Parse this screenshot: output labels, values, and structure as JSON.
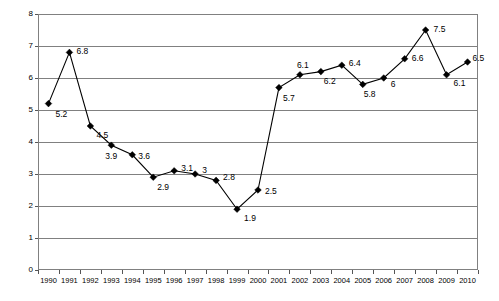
{
  "chart_data": {
    "type": "line",
    "title": "",
    "xlabel": "",
    "ylabel": "",
    "categories": [
      "1990",
      "1991",
      "1992",
      "1993",
      "1994",
      "1995",
      "1996",
      "1997",
      "1998",
      "1999",
      "2000",
      "2001",
      "2002",
      "2003",
      "2004",
      "2005",
      "2006",
      "2007",
      "2008",
      "2009",
      "2010"
    ],
    "values": [
      5.2,
      6.8,
      4.5,
      3.9,
      3.6,
      2.9,
      3.1,
      3.0,
      2.8,
      1.9,
      2.5,
      5.7,
      6.1,
      6.2,
      6.4,
      5.8,
      6.0,
      6.6,
      7.5,
      6.1,
      6.5
    ],
    "data_labels": [
      "5.2",
      "6.8",
      "4.5",
      "3.9",
      "3.6",
      "2.9",
      "3.1",
      "3",
      "2.8",
      "1.9",
      "2.5",
      "5.7",
      "6.1",
      "6.2",
      "6.4",
      "5.8",
      "6",
      "6.6",
      "7.5",
      "6.1",
      "6.5"
    ],
    "label_offsets": [
      {
        "dx": 7,
        "dy": 10
      },
      {
        "dx": 7,
        "dy": -1
      },
      {
        "dx": 6,
        "dy": 9
      },
      {
        "dx": -6,
        "dy": 11
      },
      {
        "dx": 6,
        "dy": 1
      },
      {
        "dx": 4,
        "dy": 10
      },
      {
        "dx": 7,
        "dy": -3
      },
      {
        "dx": 7,
        "dy": -4
      },
      {
        "dx": 7,
        "dy": -3
      },
      {
        "dx": 7,
        "dy": 9
      },
      {
        "dx": 7,
        "dy": 1
      },
      {
        "dx": 4,
        "dy": 10
      },
      {
        "dx": -3,
        "dy": -10
      },
      {
        "dx": 3,
        "dy": 9
      },
      {
        "dx": 7,
        "dy": -2
      },
      {
        "dx": 1,
        "dy": 10
      },
      {
        "dx": 7,
        "dy": 6
      },
      {
        "dx": 7,
        "dy": -1
      },
      {
        "dx": 8,
        "dy": -1
      },
      {
        "dx": 7,
        "dy": 8
      },
      {
        "dx": 5,
        "dy": -4
      }
    ],
    "ylim": [
      0,
      8
    ],
    "ytick_values": [
      0,
      1,
      2,
      3,
      4,
      5,
      6,
      7,
      8
    ],
    "ytick_labels": [
      "0",
      "1",
      "2",
      "3",
      "4",
      "5",
      "6",
      "7",
      "8"
    ],
    "grid": true,
    "grid_color": "#808080",
    "legend": false,
    "legend_position": "none",
    "series_color": "#000000",
    "marker": "diamond",
    "plot_border_color": "#808080",
    "background": "#ffffff"
  }
}
